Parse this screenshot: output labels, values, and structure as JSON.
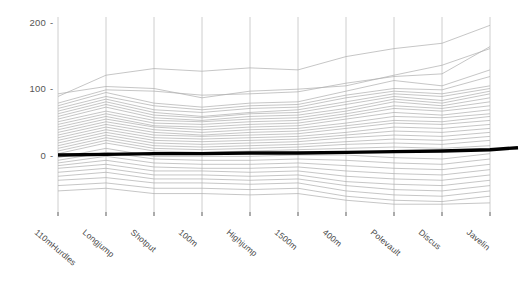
{
  "figure": {
    "kind": "parallel-coordinates-plot",
    "background_color": "#ffffff",
    "line_color": "#b0b0b0",
    "highlight_color": "#000000",
    "axis_color": "#c8c8c8",
    "tick_text_color": "#555555",
    "label_text_color": "#4a4a4a"
  },
  "chart_data": {
    "type": "line",
    "title": "",
    "xlabel": "",
    "ylabel": "",
    "grid": false,
    "legend_position": "none",
    "axis_orientation": "vertical-parallel-axes",
    "categories": [
      "110mHurdles",
      "Longjump",
      "Shotput",
      "100m",
      "Highjump",
      "1500m",
      "400m",
      "Polevault",
      "Discus",
      "Javelin"
    ],
    "yticks": [
      0,
      100,
      200
    ],
    "ytick_labels": [
      "0",
      "100",
      "200"
    ],
    "ylim": [
      -80,
      215
    ],
    "series": [
      {
        "name": "athlete-01",
        "values": [
          88,
          120,
          130,
          126,
          131,
          128,
          148,
          160,
          168,
          195
        ],
        "highlight": false
      },
      {
        "name": "athlete-02",
        "values": [
          92,
          103,
          100,
          86,
          96,
          99,
          104,
          120,
          135,
          160
        ]
      },
      {
        "name": "athlete-03",
        "values": [
          78,
          98,
          96,
          90,
          92,
          95,
          108,
          118,
          122,
          163
        ]
      },
      {
        "name": "athlete-04",
        "values": [
          74,
          94,
          78,
          72,
          78,
          80,
          96,
          112,
          104,
          128
        ]
      },
      {
        "name": "athlete-05",
        "values": [
          70,
          88,
          74,
          68,
          74,
          76,
          90,
          100,
          98,
          118
        ]
      },
      {
        "name": "athlete-06",
        "values": [
          66,
          84,
          68,
          64,
          70,
          72,
          86,
          96,
          92,
          104
        ]
      },
      {
        "name": "athlete-07",
        "values": [
          62,
          80,
          64,
          58,
          64,
          68,
          80,
          92,
          88,
          100
        ]
      },
      {
        "name": "athlete-08",
        "values": [
          58,
          76,
          60,
          56,
          62,
          64,
          76,
          88,
          82,
          96
        ]
      },
      {
        "name": "athlete-09",
        "values": [
          54,
          72,
          56,
          52,
          58,
          60,
          70,
          84,
          78,
          92
        ]
      },
      {
        "name": "athlete-10",
        "values": [
          50,
          66,
          52,
          50,
          54,
          56,
          66,
          80,
          74,
          86
        ]
      },
      {
        "name": "athlete-11",
        "values": [
          46,
          62,
          48,
          46,
          50,
          52,
          62,
          74,
          70,
          80
        ]
      },
      {
        "name": "athlete-12",
        "values": [
          42,
          58,
          44,
          42,
          46,
          48,
          58,
          70,
          66,
          74
        ]
      },
      {
        "name": "athlete-13",
        "values": [
          38,
          54,
          42,
          38,
          42,
          44,
          54,
          64,
          60,
          68
        ]
      },
      {
        "name": "athlete-14",
        "values": [
          34,
          50,
          38,
          34,
          38,
          40,
          48,
          58,
          56,
          62
        ]
      },
      {
        "name": "athlete-15",
        "values": [
          30,
          46,
          34,
          30,
          34,
          36,
          44,
          52,
          50,
          58
        ]
      },
      {
        "name": "athlete-16",
        "values": [
          26,
          42,
          30,
          28,
          30,
          32,
          40,
          48,
          46,
          52
        ]
      },
      {
        "name": "athlete-17",
        "values": [
          22,
          38,
          26,
          24,
          26,
          28,
          34,
          42,
          40,
          46
        ]
      },
      {
        "name": "athlete-18",
        "values": [
          18,
          34,
          22,
          20,
          22,
          24,
          30,
          36,
          34,
          40
        ]
      },
      {
        "name": "athlete-19",
        "values": [
          14,
          30,
          18,
          16,
          18,
          20,
          26,
          30,
          28,
          34
        ]
      },
      {
        "name": "athlete-20",
        "values": [
          10,
          26,
          14,
          12,
          14,
          16,
          20,
          24,
          22,
          28
        ]
      },
      {
        "name": "athlete-21",
        "values": [
          6,
          22,
          10,
          8,
          10,
          12,
          16,
          18,
          16,
          22
        ]
      },
      {
        "name": "athlete-22",
        "values": [
          2,
          18,
          6,
          4,
          6,
          8,
          10,
          12,
          10,
          14
        ]
      },
      {
        "name": "athlete-23-highlighted",
        "values": [
          0,
          1,
          2,
          2,
          3,
          3,
          4,
          5,
          6,
          8
        ],
        "highlight": true
      },
      {
        "name": "athlete-24",
        "values": [
          -4,
          10,
          -2,
          -2,
          -2,
          0,
          0,
          -4,
          -6,
          2
        ]
      },
      {
        "name": "athlete-25",
        "values": [
          -8,
          4,
          -6,
          -8,
          -8,
          -6,
          -8,
          -12,
          -14,
          -6
        ]
      },
      {
        "name": "athlete-26",
        "values": [
          -12,
          -2,
          -12,
          -14,
          -14,
          -12,
          -16,
          -20,
          -22,
          -14
        ]
      },
      {
        "name": "athlete-27",
        "values": [
          -16,
          -8,
          -18,
          -20,
          -20,
          -18,
          -24,
          -28,
          -30,
          -22
        ]
      },
      {
        "name": "athlete-28",
        "values": [
          -20,
          -14,
          -24,
          -24,
          -26,
          -24,
          -32,
          -36,
          -38,
          -30
        ]
      },
      {
        "name": "athlete-29",
        "values": [
          -26,
          -20,
          -30,
          -30,
          -32,
          -30,
          -40,
          -44,
          -46,
          -38
        ]
      },
      {
        "name": "athlete-30",
        "values": [
          -32,
          -26,
          -36,
          -36,
          -38,
          -36,
          -46,
          -52,
          -54,
          -46
        ]
      },
      {
        "name": "athlete-31",
        "values": [
          -38,
          -34,
          -42,
          -42,
          -44,
          -42,
          -54,
          -60,
          -62,
          -54
        ]
      },
      {
        "name": "athlete-32",
        "values": [
          -46,
          -42,
          -50,
          -50,
          -52,
          -50,
          -62,
          -68,
          -70,
          -62
        ]
      },
      {
        "name": "athlete-33",
        "values": [
          -54,
          -50,
          -58,
          -58,
          -60,
          -58,
          -68,
          -74,
          -74,
          -72
        ]
      }
    ]
  },
  "axes_labels": [
    {
      "text": "110mHurdles"
    },
    {
      "text": "Longjump"
    },
    {
      "text": "Shotput"
    },
    {
      "text": "100m"
    },
    {
      "text": "Highjump"
    },
    {
      "text": "1500m"
    },
    {
      "text": "400m"
    },
    {
      "text": "Polevault"
    },
    {
      "text": "Discus"
    },
    {
      "text": "Javelin"
    }
  ],
  "ytick_text": {
    "t0": "0",
    "t100": "100",
    "t200": "200",
    "dash": "-"
  }
}
